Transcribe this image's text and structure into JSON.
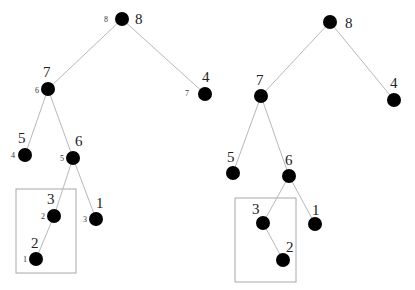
{
  "diagram": {
    "type": "binary-tree-comparison",
    "colors": {
      "node": "#000000",
      "edge": "#b8b8b8",
      "box": "#a8a8a8"
    },
    "trees": [
      {
        "name": "left-tree",
        "highlight_box": {
          "x": 16,
          "y": 189,
          "w": 60,
          "h": 84
        },
        "nodes": [
          {
            "id": "L8",
            "label": "8",
            "index": "8",
            "x": 122,
            "y": 19
          },
          {
            "id": "L7",
            "label": "7",
            "index": "6",
            "x": 48,
            "y": 89
          },
          {
            "id": "L4",
            "label": "4",
            "index": "7",
            "x": 205,
            "y": 94
          },
          {
            "id": "L5",
            "label": "5",
            "index": "4",
            "x": 25,
            "y": 155
          },
          {
            "id": "L6",
            "label": "6",
            "index": "5",
            "x": 73,
            "y": 158
          },
          {
            "id": "L3",
            "label": "3",
            "index": "2",
            "x": 54,
            "y": 216
          },
          {
            "id": "L1",
            "label": "1",
            "index": "3",
            "x": 96,
            "y": 219
          },
          {
            "id": "L2",
            "label": "2",
            "index": "1",
            "x": 36,
            "y": 259
          }
        ],
        "edges": [
          [
            "L8",
            "L7"
          ],
          [
            "L8",
            "L4"
          ],
          [
            "L7",
            "L5"
          ],
          [
            "L7",
            "L6"
          ],
          [
            "L6",
            "L3"
          ],
          [
            "L6",
            "L1"
          ],
          [
            "L3",
            "L2"
          ]
        ]
      },
      {
        "name": "right-tree",
        "highlight_box": {
          "x": 235,
          "y": 198,
          "w": 61,
          "h": 84
        },
        "nodes": [
          {
            "id": "R8",
            "label": "8",
            "x": 330,
            "y": 22
          },
          {
            "id": "R7",
            "label": "7",
            "x": 261,
            "y": 96
          },
          {
            "id": "R4",
            "label": "4",
            "x": 394,
            "y": 100
          },
          {
            "id": "R5",
            "label": "5",
            "x": 233,
            "y": 173
          },
          {
            "id": "R6",
            "label": "6",
            "x": 289,
            "y": 176
          },
          {
            "id": "R3",
            "label": "3",
            "x": 263,
            "y": 223
          },
          {
            "id": "R1",
            "label": "1",
            "x": 315,
            "y": 224
          },
          {
            "id": "R2",
            "label": "2",
            "x": 283,
            "y": 260
          }
        ],
        "edges": [
          [
            "R8",
            "R7"
          ],
          [
            "R8",
            "R4"
          ],
          [
            "R7",
            "R5"
          ],
          [
            "R7",
            "R6"
          ],
          [
            "R6",
            "R3"
          ],
          [
            "R6",
            "R1"
          ],
          [
            "R3",
            "R2"
          ]
        ]
      }
    ]
  },
  "labels": {
    "left": {
      "n8": "8",
      "n8_idx": "8",
      "n7": "7",
      "n7_idx": "6",
      "n4": "4",
      "n4_idx": "7",
      "n5": "5",
      "n5_idx": "4",
      "n6": "6",
      "n6_idx": "5",
      "n3": "3",
      "n3_idx": "2",
      "n1": "1",
      "n1_idx": "3",
      "n2": "2",
      "n2_idx": "1"
    },
    "right": {
      "n8": "8",
      "n7": "7",
      "n4": "4",
      "n5": "5",
      "n6": "6",
      "n3": "3",
      "n1": "1",
      "n2": "2"
    }
  }
}
